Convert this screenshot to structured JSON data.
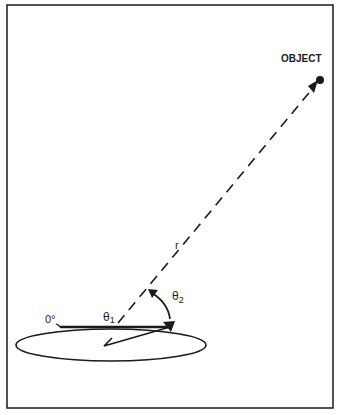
{
  "diagram": {
    "labels": {
      "object": "OBJECT",
      "range": "r",
      "theta1": "θ",
      "theta1_sub": "1",
      "theta2": "θ",
      "theta2_sub": "2",
      "zero_deg": "0°"
    },
    "colors": {
      "ink": "#1a1a1a",
      "background": "#ffffff"
    }
  }
}
